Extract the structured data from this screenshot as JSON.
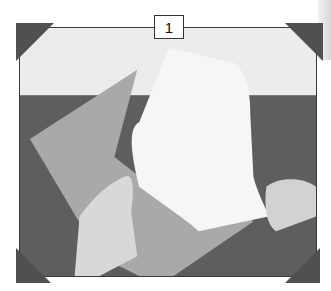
{
  "figure": {
    "step_number": "1",
    "colors": {
      "frame_border": "#3a3a3a",
      "corner_marks": "#505050",
      "background_top": "#ececec",
      "table_surface": "#5c5c5c",
      "envelope": "#a8a8a8",
      "card": "#f5f5f5"
    }
  }
}
